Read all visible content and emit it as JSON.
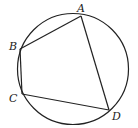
{
  "diagram": {
    "type": "cyclic-quadrilateral-inscribed-in-circle",
    "points": [
      {
        "id": "A",
        "label": "A"
      },
      {
        "id": "B",
        "label": "B"
      },
      {
        "id": "C",
        "label": "C"
      },
      {
        "id": "D",
        "label": "D"
      }
    ],
    "segments": [
      {
        "from": "A",
        "to": "B"
      },
      {
        "from": "B",
        "to": "C"
      },
      {
        "from": "C",
        "to": "D"
      },
      {
        "from": "D",
        "to": "A"
      }
    ]
  }
}
